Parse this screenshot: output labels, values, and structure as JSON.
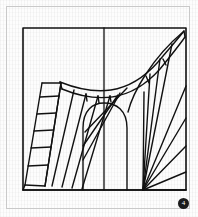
{
  "plate": {
    "title": "Curved Winder Staircase — Descriptive Geometry Plate",
    "figure_number": "4",
    "ink_color": "#111111",
    "paper_color": "#fdfdfd",
    "frame_color": "#c9c9c9",
    "drawing_frame": {
      "x": 23,
      "y": 28,
      "width": 163,
      "height": 162
    },
    "elements": {
      "outer_frame_label": "plate-border",
      "drawing_frame_label": "drawing-frame",
      "center_divider_label": "vertical-center-line",
      "left_stair_label": "left-straight-flight",
      "winder_fan_label": "left-winder-fan",
      "newel_label": "central-newel-arch",
      "right_fan_label": "right-radiating-fan",
      "curved_band_label": "curved-handrail-band"
    }
  },
  "geometry": {
    "frame": {
      "left": 23,
      "top": 28,
      "right": 186,
      "bottom": 190
    },
    "center_line_x": 104,
    "right_fan_apex": {
      "x": 143,
      "y": 190
    },
    "left_flight": {
      "top_outer": {
        "x": 42,
        "y": 83
      },
      "top_inner": {
        "x": 60,
        "y": 82
      },
      "bottom_outer": {
        "x": 25,
        "y": 185
      },
      "bottom_inner": {
        "x": 45,
        "y": 186
      },
      "tread_count": 6
    },
    "newel": {
      "left_x": 83,
      "right_x": 127,
      "apex_y": 107,
      "base_y": 190
    },
    "curve": {
      "start": {
        "x": 60,
        "y": 82
      },
      "control": {
        "x": 128,
        "y": 92
      },
      "end": {
        "x": 183,
        "y": 31
      }
    },
    "winder_ray_count": 8,
    "right_fan_ray_count": 9
  }
}
